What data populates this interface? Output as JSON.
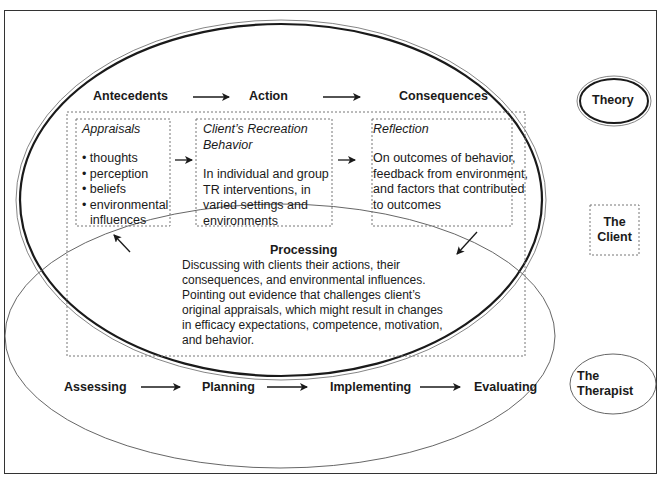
{
  "top_row": {
    "antecedents": "Antecedents",
    "action": "Action",
    "consequences": "Consequences"
  },
  "boxes": {
    "appraisals": {
      "title": "Appraisals",
      "items": [
        "thoughts",
        "perception",
        "beliefs",
        "environmental",
        "influences"
      ]
    },
    "behavior": {
      "title_line1": "Client’s Recreation",
      "title_line2": "Behavior",
      "body": [
        "In individual and group",
        "TR interventions, in",
        "varied settings and",
        "environments"
      ]
    },
    "reflection": {
      "title": "Reflection",
      "body": [
        "On outcomes of behavior,",
        "feedback from environment,",
        "and factors that contributed",
        "to outcomes"
      ]
    }
  },
  "processing": {
    "title": "Processing",
    "body": [
      "Discussing with clients their actions, their",
      "consequences, and environmental influences.",
      "Pointing out evidence that challenges client’s",
      "original appraisals, which might result in changes",
      "in efficacy expectations, competence, motivation,",
      "and behavior."
    ]
  },
  "bottom_row": {
    "assessing": "Assessing",
    "planning": "Planning",
    "implementing": "Implementing",
    "evaluating": "Evaluating"
  },
  "labels": {
    "theory": "Theory",
    "client_line1": "The",
    "client_line2": "Client",
    "therapist_line1": "The",
    "therapist_line2": "Therapist"
  },
  "colors": {
    "stroke": "#1a1a1a",
    "thin_stroke": "#555555",
    "dotted": "#777777"
  }
}
